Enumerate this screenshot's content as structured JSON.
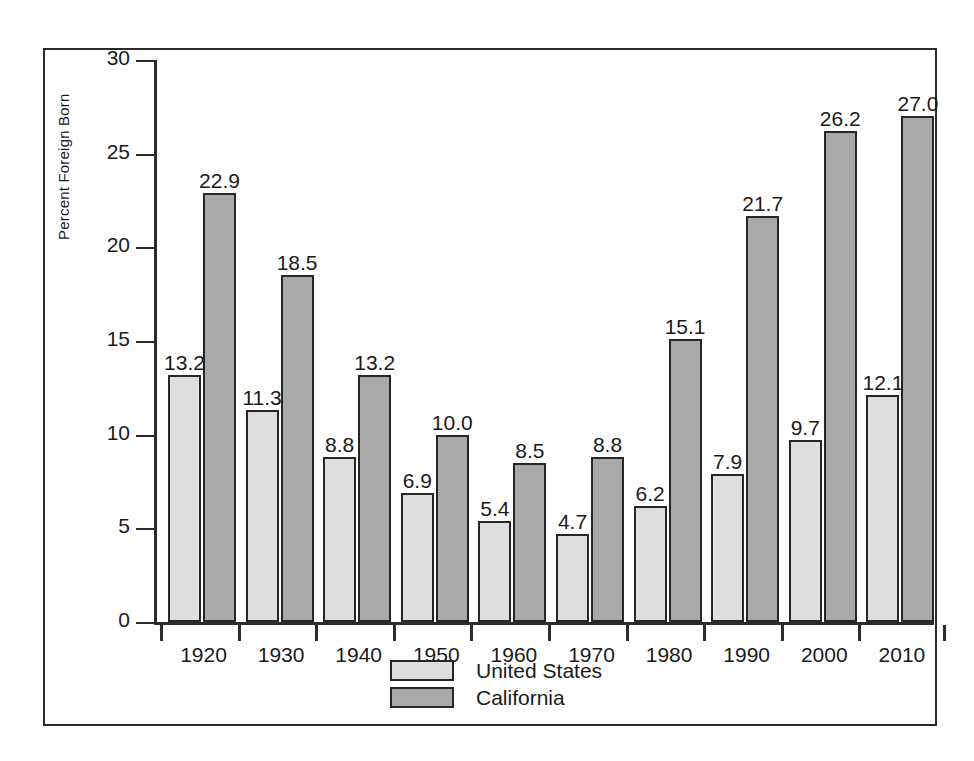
{
  "chart_data": {
    "type": "bar",
    "title": "",
    "subtitle": "",
    "xlabel": "",
    "ylabel": "Percent Foreign Born",
    "ylim": [
      0,
      30
    ],
    "yticks": [
      "0",
      "5",
      "10",
      "15",
      "20",
      "25",
      "30"
    ],
    "ytick_values": [
      0,
      5,
      10,
      15,
      20,
      25,
      30
    ],
    "grid": false,
    "legend_position": "bottom-center",
    "categories": [
      "1920",
      "1930",
      "1940",
      "1950",
      "1960",
      "1970",
      "1980",
      "1990",
      "2000",
      "2010"
    ],
    "series": [
      {
        "name": "United States",
        "color": "#dedede",
        "values": [
          13.2,
          11.3,
          8.8,
          6.9,
          5.4,
          4.7,
          6.2,
          7.9,
          9.7,
          12.1
        ],
        "labels": [
          "13.2",
          "11.3",
          "8.8",
          "6.9",
          "5.4",
          "4.7",
          "6.2",
          "7.9",
          "9.7",
          "12.1"
        ]
      },
      {
        "name": "California",
        "color": "#a9a9a9",
        "values": [
          22.9,
          18.5,
          13.2,
          10.0,
          8.5,
          8.8,
          15.1,
          21.7,
          26.2,
          27.0
        ],
        "labels": [
          "22.9",
          "18.5",
          "13.2",
          "10.0",
          "8.5",
          "8.8",
          "15.1",
          "21.7",
          "26.2",
          "27.0"
        ]
      }
    ],
    "legend": [
      {
        "label": "United States",
        "color": "#dedede"
      },
      {
        "label": "California",
        "color": "#a9a9a9"
      }
    ]
  }
}
